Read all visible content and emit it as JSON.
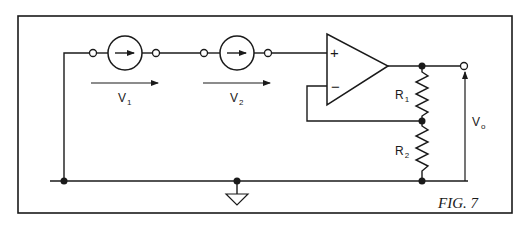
{
  "figure": {
    "caption": "FIG. 7",
    "colors": {
      "ink": "#1a1a1a",
      "background": "#ffffff"
    }
  },
  "sources": [
    {
      "id": "V1",
      "label": "V",
      "subscript": "1",
      "type": "voltage-source-arrow"
    },
    {
      "id": "V2",
      "label": "V",
      "subscript": "2",
      "type": "voltage-source-arrow"
    }
  ],
  "opamp": {
    "plus_label": "+",
    "minus_label": "−"
  },
  "resistors": [
    {
      "id": "R1",
      "label": "R",
      "subscript": "1"
    },
    {
      "id": "R2",
      "label": "R",
      "subscript": "2"
    }
  ],
  "output": {
    "label": "V",
    "subscript": "o"
  },
  "ground": {
    "symbol": "ground-triangle"
  }
}
